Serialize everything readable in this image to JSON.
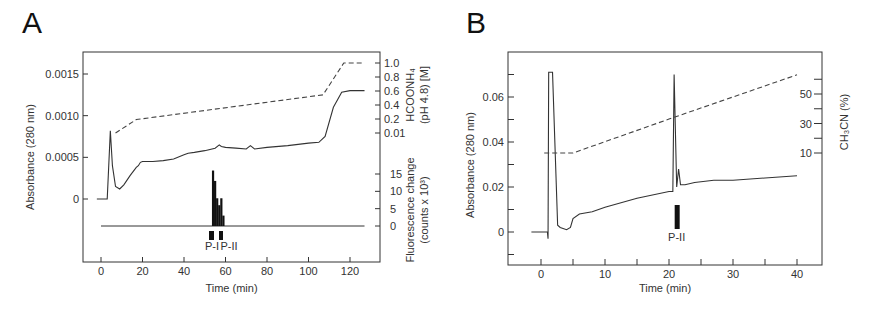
{
  "chart_data": [
    {
      "panel": "A",
      "type": "line",
      "xlabel": "Time (min)",
      "ylabel": "Absorbance (280 nm)",
      "ylabel_right_top": [
        "HCOONH₄",
        "(pH 4.8) [M]"
      ],
      "ylabel_right_bottom": [
        "Fluorescence change",
        "(counts x 10³)"
      ],
      "x_ticks": [
        0,
        20,
        40,
        60,
        80,
        100,
        120
      ],
      "y_ticks": [
        "0",
        "0.0005",
        "0.0010",
        "0.0015"
      ],
      "y_right_top_ticks": [
        "0.01",
        "0.2",
        "0.4",
        "0.6",
        "0.8",
        "1.0"
      ],
      "y_right_bottom_ticks": [
        "0",
        "5",
        "10",
        "15"
      ],
      "xlim": [
        -8,
        135
      ],
      "ylim": [
        -0.00055,
        0.0018
      ],
      "series": [
        {
          "name": "Absorbance (280 nm)",
          "style": "solid",
          "x": [
            -2,
            3,
            4.5,
            5.5,
            7,
            9,
            11,
            14,
            17,
            18,
            19,
            20,
            25,
            30,
            35,
            40,
            42,
            45,
            50,
            55,
            57,
            58,
            60,
            65,
            70,
            72,
            74,
            80,
            90,
            100,
            105,
            108,
            112,
            116,
            120,
            127
          ],
          "y": [
            0,
            0,
            0.00082,
            0.0004,
            0.00015,
            0.00012,
            0.00017,
            0.00028,
            0.00038,
            0.0004,
            0.00044,
            0.00045,
            0.00045,
            0.00046,
            0.00048,
            0.00053,
            0.00055,
            0.00056,
            0.00058,
            0.00061,
            0.00065,
            0.00063,
            0.00062,
            0.00061,
            0.0006,
            0.00064,
            0.0006,
            0.00062,
            0.00064,
            0.00067,
            0.00068,
            0.00075,
            0.0011,
            0.00128,
            0.0013,
            0.0013
          ]
        },
        {
          "name": "HCOONH4 gradient (M)",
          "style": "dashed",
          "axis": "right_top",
          "x": [
            7,
            17,
            107,
            117,
            127
          ],
          "y": [
            0.01,
            0.2,
            0.55,
            1.0,
            1.0
          ]
        },
        {
          "name": "Fluorescence change (counts x 10^3)",
          "style": "bar",
          "axis": "right_bottom",
          "x": [
            54,
            55,
            56,
            57,
            58,
            59
          ],
          "y": [
            16,
            13,
            8,
            6,
            8,
            3
          ]
        }
      ],
      "annotations": [
        "P-I",
        "P-II"
      ]
    },
    {
      "panel": "B",
      "type": "line",
      "xlabel": "Time (min)",
      "ylabel": "Absorbance (280 nm)",
      "ylabel_right": "CH₃CN (%)",
      "x_ticks": [
        0,
        10,
        20,
        30,
        40
      ],
      "y_ticks": [
        "0",
        "0.02",
        "0.04",
        "0.06"
      ],
      "y_right_ticks": [
        "10",
        "30",
        "50"
      ],
      "xlim": [
        -5,
        44
      ],
      "ylim": [
        -0.015,
        0.08
      ],
      "series": [
        {
          "name": "Absorbance (280 nm)",
          "style": "solid",
          "x": [
            -1.5,
            1,
            1.1,
            1.2,
            1.4,
            1.8,
            2.6,
            3,
            4,
            4.6,
            5,
            6,
            8,
            10,
            15,
            20,
            20.6,
            20.8,
            21.2,
            21.5,
            21.8,
            22,
            22.5,
            24,
            27,
            30,
            35,
            40
          ],
          "y": [
            0,
            0,
            -0.003,
            0.071,
            0.071,
            0.071,
            0.003,
            0.002,
            0.001,
            0.002,
            0.006,
            0.008,
            0.009,
            0.011,
            0.015,
            0.018,
            0.018,
            0.07,
            0.02,
            0.028,
            0.021,
            0.021,
            0.021,
            0.022,
            0.023,
            0.023,
            0.024,
            0.025
          ]
        },
        {
          "name": "CH3CN gradient (%)",
          "style": "dashed",
          "axis": "right",
          "x": [
            0.5,
            5,
            20,
            40
          ],
          "y": [
            10,
            10,
            33,
            63
          ]
        }
      ],
      "annotations": [
        "P-II"
      ]
    }
  ],
  "labels": {
    "panel_a": "A",
    "panel_b": "B",
    "a_xlabel": "Time (min)",
    "a_ylabel": "Absorbance (280 nm)",
    "a_right_top_1": "HCOONH₄",
    "a_right_top_2": "(pH 4.8) [M]",
    "a_right_bot_1": "Fluorescence change",
    "a_right_bot_2": "(counts x 10³)",
    "a_pi": "P-I",
    "a_pii": "P-II",
    "b_xlabel": "Time (min)",
    "b_ylabel": "Absorbance (280 nm)",
    "b_right": "CH₃CN (%)",
    "b_pii": "P-II"
  }
}
